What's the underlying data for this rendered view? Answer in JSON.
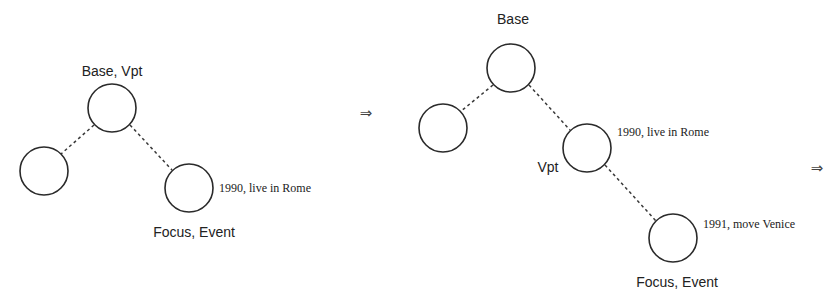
{
  "diagram": {
    "arrows": [
      "⇒",
      "⇒"
    ],
    "left_tree": {
      "root_label": "Base, Vpt",
      "focus_label": "Focus, Event",
      "event_annotation": "1990, live in Rome",
      "nodes": [
        "root",
        "left-child",
        "right-child"
      ],
      "edges": [
        [
          "root",
          "left-child"
        ],
        [
          "root",
          "right-child"
        ]
      ]
    },
    "right_tree": {
      "root_label": "Base",
      "vpt_label": "Vpt",
      "focus_label": "Focus, Event",
      "event_annotation_1": "1990, live in Rome",
      "event_annotation_2": "1991, move Venice",
      "nodes": [
        "root",
        "left-child",
        "right-child",
        "grandchild"
      ],
      "edges": [
        [
          "root",
          "left-child"
        ],
        [
          "root",
          "right-child"
        ],
        [
          "right-child",
          "grandchild"
        ]
      ]
    }
  }
}
